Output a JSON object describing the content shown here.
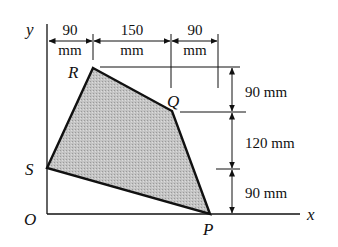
{
  "diagram": {
    "axes": {
      "x_label": "x",
      "y_label": "y",
      "origin_label": "O"
    },
    "points": {
      "R": {
        "label": "R"
      },
      "Q": {
        "label": "Q"
      },
      "P": {
        "label": "P"
      },
      "S": {
        "label": "S"
      }
    },
    "horizontal_dimensions": [
      {
        "value": "90",
        "unit": "mm"
      },
      {
        "value": "150",
        "unit": "mm"
      },
      {
        "value": "90",
        "unit": "mm"
      }
    ],
    "vertical_dimensions": [
      {
        "text": "90 mm"
      },
      {
        "text": "120 mm"
      },
      {
        "text": "90 mm"
      }
    ],
    "colors": {
      "shade": "#bdbdbd",
      "line": "#111111"
    }
  }
}
